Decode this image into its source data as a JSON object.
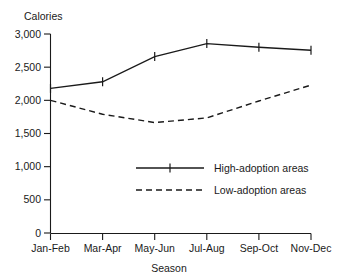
{
  "chart_data": {
    "type": "line",
    "title": "",
    "xlabel": "Season",
    "ylabel": "Calories",
    "categories": [
      "Jan-Feb",
      "Mar-Apr",
      "May-Jun",
      "Jul-Aug",
      "Sep-Oct",
      "Nov-Dec"
    ],
    "ylim": [
      0,
      3000
    ],
    "yticks": [
      0,
      500,
      1000,
      1500,
      2000,
      2500,
      3000
    ],
    "ytick_labels": [
      "0",
      "500",
      "1,000",
      "1,500",
      "2,000",
      "2,500",
      "3,000"
    ],
    "grid": false,
    "legend_position": "center",
    "series": [
      {
        "name": "High-adoption areas",
        "style": "solid",
        "marker": "cross",
        "values": [
          2180,
          2280,
          2660,
          2855,
          2800,
          2755
        ]
      },
      {
        "name": "Low-adoption areas",
        "style": "dashed",
        "marker": "none",
        "values": [
          2000,
          1790,
          1665,
          1735,
          1990,
          2230
        ]
      }
    ],
    "colors": {
      "axis": "#1a1a1a",
      "high_adoption": "#1a1a1a",
      "low_adoption": "#1a1a1a",
      "background": "#ffffff"
    }
  }
}
